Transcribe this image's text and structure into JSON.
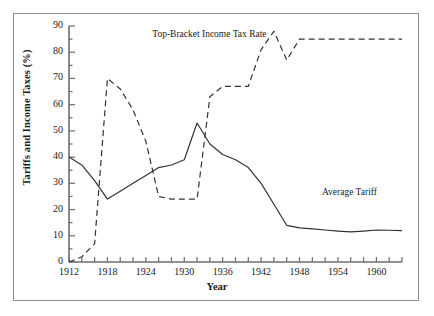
{
  "chart_data": {
    "type": "line",
    "title": "",
    "xlabel": "Year",
    "ylabel": "Tariffs and Income Taxes (%)",
    "xlim": [
      1912,
      1964
    ],
    "ylim": [
      0,
      90
    ],
    "ytick_step": 10,
    "yminor_step": 5,
    "xtick_step": 2,
    "xlabel_step": 6,
    "grid": false,
    "legend_position": "inline-annotations",
    "ytick_labels": [
      "0",
      "10",
      "20",
      "30",
      "40",
      "50",
      "60",
      "70",
      "80",
      "90"
    ],
    "xtick_labels": [
      "1912",
      "1918",
      "1924",
      "1930",
      "1936",
      "1942",
      "1948",
      "1954",
      "1960"
    ],
    "xtick_values": [
      1912,
      1914,
      1916,
      1918,
      1920,
      1922,
      1924,
      1926,
      1928,
      1930,
      1932,
      1934,
      1936,
      1938,
      1940,
      1942,
      1944,
      1946,
      1948,
      1950,
      1952,
      1954,
      1956,
      1958,
      1960,
      1962,
      1964
    ],
    "series": [
      {
        "name": "Top-Bracket Income Tax Rate",
        "style": "dashed",
        "color": "#333333",
        "annotation": "Top-Bracket Income Tax Rate",
        "x": [
          1912,
          1914,
          1916,
          1918,
          1920,
          1922,
          1924,
          1926,
          1928,
          1930,
          1932,
          1934,
          1936,
          1938,
          1940,
          1942,
          1944,
          1946,
          1948,
          1950,
          1952,
          1954,
          1956,
          1958,
          1960,
          1962,
          1964
        ],
        "values": [
          0,
          2,
          7,
          70,
          66,
          58,
          46,
          25,
          24,
          24,
          24,
          63,
          67,
          67,
          67,
          81,
          88,
          77,
          85,
          85,
          85,
          85,
          85,
          85,
          85,
          85,
          85
        ]
      },
      {
        "name": "Average Tariff",
        "style": "solid",
        "color": "#333333",
        "annotation": "Average Tariff",
        "x": [
          1912,
          1914,
          1916,
          1918,
          1920,
          1922,
          1924,
          1926,
          1928,
          1930,
          1932,
          1934,
          1936,
          1938,
          1940,
          1942,
          1944,
          1946,
          1948,
          1950,
          1952,
          1954,
          1956,
          1958,
          1960,
          1962,
          1964
        ],
        "values": [
          40,
          37,
          31,
          24,
          27,
          30,
          33,
          36,
          37,
          39,
          53,
          45,
          41,
          39,
          36,
          30,
          22,
          14,
          13,
          12.6,
          12.2,
          11.8,
          11.5,
          11.8,
          12.2,
          12.1,
          12.0
        ]
      }
    ],
    "annotations": [
      {
        "text": "Top-Bracket Income Tax Rate",
        "x": 1925,
        "y": 86
      },
      {
        "text": "Average Tariff",
        "x": 1951.5,
        "y": 26
      }
    ]
  }
}
